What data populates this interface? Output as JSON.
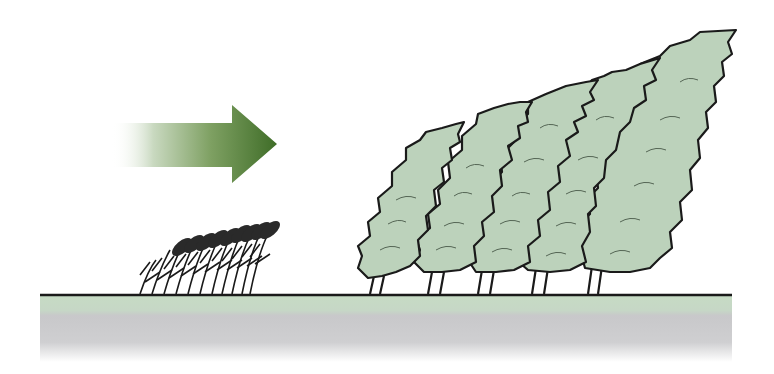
{
  "scene": {
    "description": "Wind blowing from left bends crops and a row of tall trees",
    "colors": {
      "arrow": "#4a7a30",
      "foliage": "#bcd2bb",
      "outline": "#1a1a1a",
      "ground_green": "#c6dbc4",
      "ground_gray": "#c4c4c6"
    },
    "elements": {
      "arrow": "wind-direction-arrow",
      "crops": "wheat-crops",
      "trees_count": 5
    }
  }
}
